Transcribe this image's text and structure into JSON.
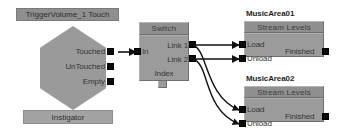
{
  "canvas": {
    "width": 341,
    "height": 139,
    "background": "#ffffff"
  },
  "palette": {
    "node_body": "#9b9b9b",
    "node_header": "#8f8f8f",
    "pin": "#0b0b0b",
    "wire": "#111111",
    "label_text": "#353535",
    "caption_text": "#1e1e1e"
  },
  "nodes": {
    "event": {
      "title": "TriggerVolume_1 Touch",
      "shape": "hexagon",
      "outputs": [
        {
          "label": "Touched"
        },
        {
          "label": "UnTouched"
        },
        {
          "label": "Empty"
        }
      ],
      "variable": "Instigator"
    },
    "switch": {
      "title": "Switch",
      "inputs": [
        {
          "label": "In"
        }
      ],
      "outputs": [
        {
          "label": "Link 1"
        },
        {
          "label": "Link 2"
        }
      ],
      "variable": "Index"
    },
    "music_area_01": {
      "caption": "MusicArea01",
      "title": "Stream Levels",
      "inputs": [
        {
          "label": "Load"
        },
        {
          "label": "Unload"
        }
      ],
      "outputs": [
        {
          "label": "Finished"
        }
      ]
    },
    "music_area_02": {
      "caption": "MusicArea02",
      "title": "Stream Levels",
      "inputs": [
        {
          "label": "Load"
        },
        {
          "label": "Unload"
        }
      ],
      "outputs": [
        {
          "label": "Finished"
        }
      ]
    }
  },
  "connections": [
    {
      "from": "event.Touched",
      "to": "switch.In"
    },
    {
      "from": "switch.Link 1",
      "to": "music_area_01.Load"
    },
    {
      "from": "switch.Link 2",
      "to": "music_area_01.Unload"
    },
    {
      "from": "switch.Link 1",
      "to": "music_area_02.Load"
    },
    {
      "from": "switch.Link 2",
      "to": "music_area_02.Unload"
    }
  ]
}
